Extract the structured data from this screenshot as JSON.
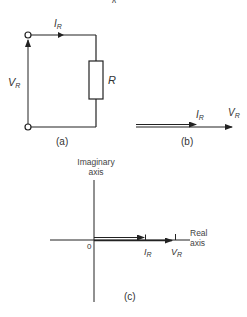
{
  "figure": {
    "top_fragment": "ʌ",
    "panel_a": {
      "caption": "(a)",
      "current_label": "I",
      "current_sub": "R",
      "voltage_label": "V",
      "voltage_sub": "R",
      "resistor_label": "R"
    },
    "panel_b": {
      "caption": "(b)",
      "current_label": "I",
      "current_sub": "R",
      "voltage_label": "V",
      "voltage_sub": "R"
    },
    "panel_c": {
      "caption": "(c)",
      "imag_axis_line1": "Imaginary",
      "imag_axis_line2": "axis",
      "real_axis_line1": "Real",
      "real_axis_line2": "axis",
      "origin_label": "0",
      "current_label": "I",
      "current_sub": "R",
      "voltage_label": "V",
      "voltage_sub": "R"
    }
  },
  "colors": {
    "ink": "#222222",
    "background": "#ffffff"
  }
}
